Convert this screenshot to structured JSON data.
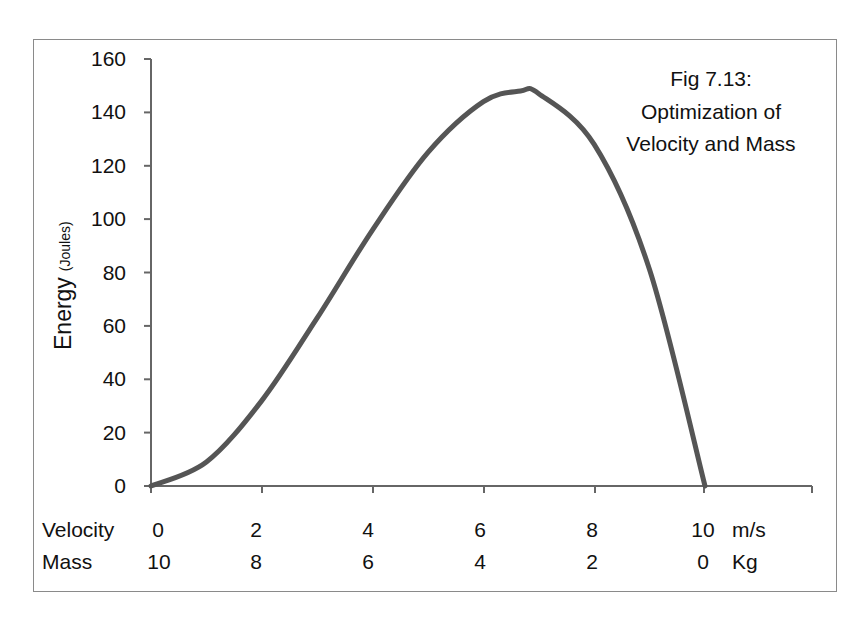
{
  "chart_data": {
    "type": "line",
    "title": "Fig 7.13: Optimization of Velocity and Mass",
    "title_lines": [
      "Fig 7.13:",
      "Optimization of",
      "Velocity and Mass"
    ],
    "ylabel": "Energy",
    "ylabel_unit": "(Joules)",
    "ylim": [
      0,
      160
    ],
    "yticks": [
      0,
      20,
      40,
      60,
      80,
      100,
      120,
      140,
      160
    ],
    "xlim": [
      0,
      12
    ],
    "x_rows": [
      {
        "label": "Velocity",
        "ticks": [
          "0",
          "2",
          "4",
          "6",
          "8",
          "10"
        ],
        "unit": "m/s"
      },
      {
        "label": "Mass",
        "ticks": [
          "10",
          "8",
          "6",
          "4",
          "2",
          "0"
        ],
        "unit": "Kg"
      }
    ],
    "grid": false,
    "legend": null,
    "series": [
      {
        "name": "Energy",
        "color": "#555555",
        "x": [
          0,
          1,
          2,
          3,
          4,
          5,
          6,
          6.67,
          7,
          8,
          9,
          10
        ],
        "values": [
          0,
          9,
          32,
          63,
          96,
          125,
          144,
          148,
          147,
          128,
          81,
          0
        ]
      }
    ]
  },
  "labels": {
    "title_1": "Fig 7.13:",
    "title_2": "Optimization of",
    "title_3": "Velocity and Mass",
    "ylabel": "Energy",
    "ylabel_unit": "(Joules)",
    "y0": "0",
    "y20": "20",
    "y40": "40",
    "y60": "60",
    "y80": "80",
    "y100": "100",
    "y120": "120",
    "y140": "140",
    "y160": "160",
    "velocity": "Velocity",
    "mass": "Mass",
    "v0": "0",
    "v2": "2",
    "v4": "4",
    "v6": "6",
    "v8": "8",
    "v10": "10",
    "v_unit": "m/s",
    "m10": "10",
    "m8": "8",
    "m6": "6",
    "m4": "4",
    "m2": "2",
    "m0": "0",
    "m_unit": "Kg"
  }
}
